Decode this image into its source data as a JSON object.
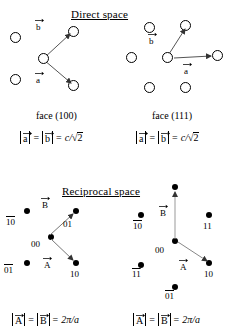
{
  "figure": {
    "sections": {
      "direct": "Direct space",
      "reciprocal": "Reciprocal space"
    },
    "panels": [
      {
        "id": "direct-100",
        "caption": "face (100)",
        "vectors": [
          {
            "name": "a",
            "label": "a"
          },
          {
            "name": "b",
            "label": "b"
          }
        ],
        "formula": {
          "lhs1": "a",
          "lhs2": "b",
          "eq": "=",
          "rhs_coef": "c",
          "rhs_slash": "/",
          "rhs_root": "√",
          "rhs_radicand": "2",
          "full": "|a| = |b| = c/√2"
        }
      },
      {
        "id": "direct-111",
        "caption": "face (111)",
        "vectors": [
          {
            "name": "a",
            "label": "a"
          },
          {
            "name": "b",
            "label": "b"
          }
        ],
        "formula": {
          "lhs1": "a",
          "lhs2": "b",
          "eq": "=",
          "rhs_coef": "c",
          "rhs_slash": "/",
          "rhs_root": "√",
          "rhs_radicand": "2",
          "full": "|a| = |b| = c/√2"
        }
      },
      {
        "id": "reciprocal-100",
        "vectors": [
          {
            "name": "A",
            "label": "A"
          },
          {
            "name": "B",
            "label": "B"
          }
        ],
        "spot_labels": [
          {
            "id": "m10bar",
            "text": "10",
            "overline_first": true
          },
          {
            "id": "m01",
            "text": "01",
            "overline_first": false
          },
          {
            "id": "m00",
            "text": "00",
            "overline_first": false
          },
          {
            "id": "m01bar",
            "text": "01",
            "overline_last": true
          },
          {
            "id": "m10",
            "text": "10",
            "overline_first": false
          }
        ],
        "formula": {
          "lhs1": "A",
          "lhs2": "B",
          "eq": "=",
          "rhs": "2π/a",
          "full": "|A| = |B| = 2π/a"
        }
      },
      {
        "id": "reciprocal-111",
        "vectors": [
          {
            "name": "A",
            "label": "A"
          },
          {
            "name": "B",
            "label": "B"
          }
        ],
        "spot_labels": [
          {
            "id": "m10bar",
            "text": "10",
            "overline_first": true
          },
          {
            "id": "m11",
            "text": "11",
            "overline_first": false
          },
          {
            "id": "m00",
            "text": "00",
            "overline_first": false
          },
          {
            "id": "m11barbar",
            "text": "11",
            "overline_both": true
          },
          {
            "id": "m10",
            "text": "10",
            "overline_first": false
          },
          {
            "id": "m01bar",
            "text": "01",
            "overline_last": true
          }
        ],
        "formula": {
          "lhs1": "A",
          "lhs2": "B",
          "eq": "=",
          "rhs": "2π/a",
          "full": "|A| = |B| = 2π/a"
        }
      }
    ],
    "labels": {
      "index_10bar": "10",
      "index_01": "01",
      "index_00": "00",
      "index_01bar": "01",
      "index_10": "10",
      "index_11": "11",
      "index_11barbar": "11",
      "vec_a": "a",
      "vec_b": "b",
      "vec_A": "A",
      "vec_B": "B",
      "pi": "2π/a",
      "c_over_root2": "c/√2"
    },
    "colors": {
      "stroke": "#000000",
      "background": "#ffffff",
      "vector_line": "#555555"
    }
  }
}
